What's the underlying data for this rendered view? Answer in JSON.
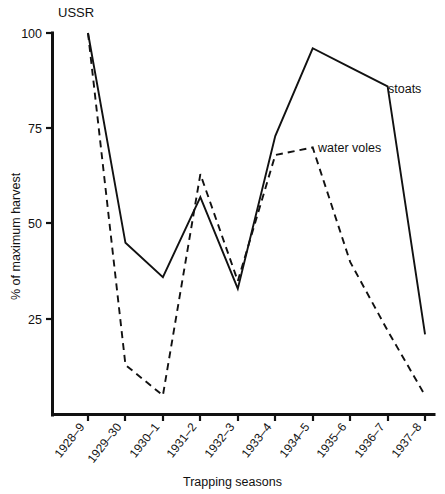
{
  "figure": {
    "corner_label": "USSR",
    "background_color": "#ffffff",
    "ink_color": "#111111"
  },
  "chart_data": {
    "type": "line",
    "title": "USSR",
    "xlabel": "Trapping seasons",
    "ylabel": "% of maximum harvest",
    "categories": [
      "1928–9",
      "1929–30",
      "1930–1",
      "1931–2",
      "1932–3",
      "1933–4",
      "1934–5",
      "1935–6",
      "1936–7",
      "1937–8"
    ],
    "ylim": [
      0,
      100
    ],
    "yticks": [
      25,
      50,
      75,
      100
    ],
    "ytick_labels": [
      "25",
      "50",
      "75",
      "100"
    ],
    "grid": false,
    "legend_position": "inline-annotations",
    "series": [
      {
        "name": "stoats",
        "style": "solid",
        "label_text": "stoats",
        "values": [
          100,
          45,
          36,
          57,
          33,
          73,
          96,
          91,
          86,
          21
        ]
      },
      {
        "name": "water voles",
        "style": "dashed",
        "label_text": "water voles",
        "values": [
          100,
          13,
          5,
          63,
          35,
          68,
          70,
          40,
          22,
          5
        ]
      }
    ],
    "annotations": [
      {
        "text": "stoats",
        "series": "stoats"
      },
      {
        "text": "water voles",
        "series": "water voles"
      }
    ]
  }
}
